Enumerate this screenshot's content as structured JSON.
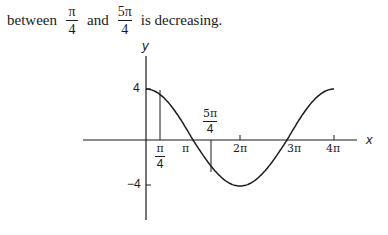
{
  "text": {
    "word_between": "between",
    "frac1_num": "π",
    "frac1_den": "4",
    "word_and": "and",
    "frac2_num": "5π",
    "frac2_den": "4",
    "word_rest": "is decreasing."
  },
  "chart_data": {
    "type": "line",
    "title": "",
    "function": "y = 4cos(x/2)",
    "xlabel": "x",
    "ylabel": "y",
    "x_ticks": [
      {
        "value_pi": 0.25,
        "label_num": "π",
        "label_den": "4"
      },
      {
        "value_pi": 1,
        "label": "π"
      },
      {
        "value_pi": 2,
        "label": "2π"
      },
      {
        "value_pi": 3,
        "label": "3π"
      },
      {
        "value_pi": 4,
        "label": "4π"
      }
    ],
    "y_ticks": [
      {
        "value": 4,
        "label": "4"
      },
      {
        "value": -4,
        "label": "−4"
      }
    ],
    "xlim_pi": [
      0,
      4
    ],
    "ylim": [
      -4,
      4
    ],
    "series": [
      {
        "name": "curve",
        "x_pi": [
          0,
          0.25,
          0.5,
          1,
          1.25,
          1.5,
          2,
          2.5,
          3,
          3.5,
          4
        ],
        "values": [
          4,
          3.92,
          3.7,
          0,
          -0.78,
          -1.53,
          -4,
          -2.83,
          0,
          2.83,
          4
        ]
      }
    ],
    "annotations": [
      {
        "type": "vertical_segment",
        "x_pi": 0.25,
        "label_num": "π",
        "label_den": "4"
      },
      {
        "type": "vertical_segment",
        "x_pi": 1.25,
        "label_num": "5π",
        "label_den": "4"
      }
    ],
    "grid": false,
    "legend": "none"
  }
}
